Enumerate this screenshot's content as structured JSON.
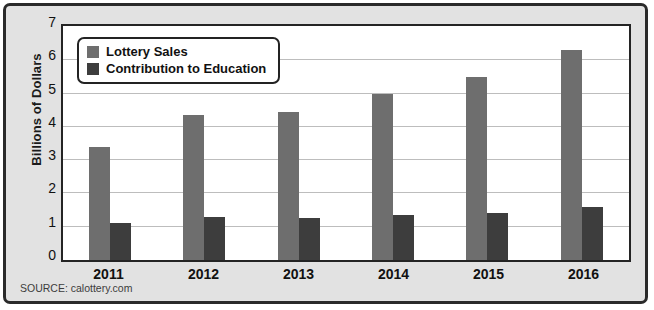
{
  "figure": {
    "source_note": "SOURCE: calottery.com"
  },
  "legend": {
    "position": "top-left-inside",
    "entries": [
      {
        "label": "Lottery Sales",
        "color": "#6e6e6e",
        "swatch": "legend-swatch-icon"
      },
      {
        "label": "Contribution to Education",
        "color": "#3d3d3d",
        "swatch": "legend-swatch-icon"
      }
    ]
  },
  "axes": {
    "y_title": "Billions of Dollars",
    "y_ticks": [
      "0",
      "1",
      "2",
      "3",
      "4",
      "5",
      "6",
      "7"
    ],
    "x_ticks": [
      "2011",
      "2012",
      "2013",
      "2014",
      "2015",
      "2016"
    ]
  },
  "chart_data": {
    "type": "bar",
    "title": "",
    "subtitle": "",
    "xlabel": "",
    "ylabel": "Billions of Dollars",
    "ylim": [
      0,
      7
    ],
    "ytick_step": 1,
    "grid": true,
    "legend_position": "upper left",
    "categories": [
      "2011",
      "2012",
      "2013",
      "2014",
      "2015",
      "2016"
    ],
    "series": [
      {
        "name": "Lottery Sales",
        "color": "#6e6e6e",
        "values": [
          3.4,
          4.35,
          4.45,
          5.0,
          5.5,
          6.3
        ]
      },
      {
        "name": "Contribution to Education",
        "color": "#3d3d3d",
        "values": [
          1.12,
          1.3,
          1.25,
          1.35,
          1.4,
          1.6
        ]
      }
    ],
    "annotations": [
      "SOURCE: calottery.com"
    ]
  },
  "colors": {
    "frame_background": "#e2e2e2",
    "frame_border": "#2a2a2a",
    "plot_background": "#ffffff",
    "plot_border": "#242424",
    "gridline": "#bdbdbd",
    "series_sales": "#6e6e6e",
    "series_education": "#3d3d3d"
  }
}
